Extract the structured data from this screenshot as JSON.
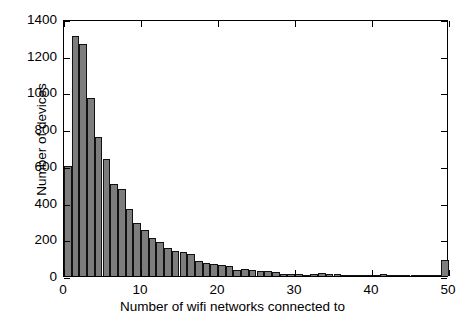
{
  "chart_data": {
    "type": "bar",
    "title": "",
    "xlabel": "Number of wifi networks connected to",
    "ylabel": "Number of devices",
    "xlim": [
      0,
      50
    ],
    "ylim": [
      0,
      1400
    ],
    "xticks": [
      0,
      10,
      20,
      30,
      40,
      50
    ],
    "xtick_labels": [
      "0",
      "10",
      "20",
      "30",
      "40",
      "50"
    ],
    "yticks": [
      0,
      200,
      400,
      600,
      800,
      1000,
      1200,
      1400
    ],
    "ytick_labels": [
      "0",
      "200",
      "400",
      "600",
      "800",
      "1000",
      "1200",
      "1400"
    ],
    "grid": false,
    "legend": null,
    "bin_width": 1,
    "bar_color": "#7d7d7d",
    "bar_edge_color": "#111111",
    "categories": [
      0,
      1,
      2,
      3,
      4,
      5,
      6,
      7,
      8,
      9,
      10,
      11,
      12,
      13,
      14,
      15,
      16,
      17,
      18,
      19,
      20,
      21,
      22,
      23,
      24,
      25,
      26,
      27,
      28,
      29,
      30,
      31,
      32,
      33,
      34,
      35,
      36,
      37,
      38,
      39,
      40,
      41,
      42,
      43,
      44,
      45,
      46,
      47,
      48,
      49
    ],
    "values": [
      600,
      1310,
      1265,
      970,
      755,
      640,
      500,
      475,
      365,
      290,
      250,
      205,
      185,
      150,
      135,
      130,
      120,
      80,
      70,
      65,
      60,
      55,
      35,
      38,
      32,
      28,
      25,
      22,
      10,
      12,
      10,
      8,
      10,
      14,
      12,
      10,
      8,
      8,
      6,
      6,
      5,
      12,
      6,
      5,
      4,
      4,
      4,
      4,
      4,
      85
    ]
  },
  "axis": {
    "x_title": "Number of wifi networks connected to",
    "y_title": "Number of devices"
  }
}
